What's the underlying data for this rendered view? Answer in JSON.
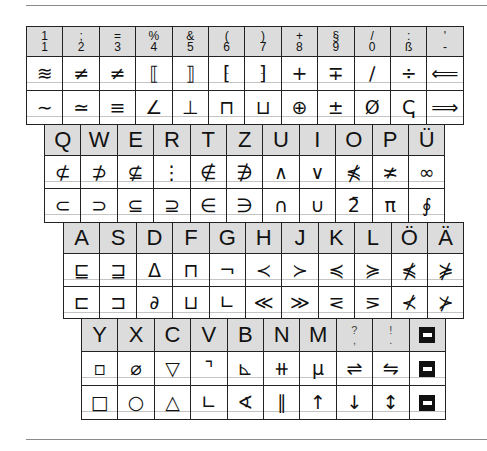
{
  "block1": {
    "header": [
      {
        "top": "1",
        "bottom": "1"
      },
      {
        "top": ";",
        "bottom": "2"
      },
      {
        "top": "=",
        "bottom": "3"
      },
      {
        "top": "%",
        "bottom": "4"
      },
      {
        "top": "&",
        "bottom": "5"
      },
      {
        "top": "(",
        "bottom": "6"
      },
      {
        "top": ")",
        "bottom": "7"
      },
      {
        "top": "+",
        "bottom": "8"
      },
      {
        "top": "§",
        "bottom": "9"
      },
      {
        "top": "/",
        "bottom": "0"
      },
      {
        "top": ":",
        "bottom": "ß"
      },
      {
        "top": "'",
        "bottom": "-"
      }
    ],
    "row2": [
      "≋",
      "≠",
      "≠",
      "⟦",
      "⟧",
      "⁅",
      "⁆",
      "+",
      "∓",
      "∕",
      "÷",
      "⟸"
    ],
    "row3": [
      "∼",
      "≃",
      "≡",
      "∠",
      "⊥",
      "⊓",
      "⊔",
      "⊕",
      "±",
      "Ø",
      "ↅ",
      "⟹"
    ]
  },
  "block2": {
    "header": [
      "Q",
      "W",
      "E",
      "R",
      "T",
      "Z",
      "U",
      "I",
      "O",
      "P",
      "Ü"
    ],
    "row2": [
      "⊄",
      "⊅",
      "⊈",
      "⋮",
      "∉",
      "∌",
      "∧",
      "∨",
      "⋠",
      "≭",
      "∞"
    ],
    "row3": [
      "⊂",
      "⊃",
      "⊆",
      "⊇",
      "∈",
      "∋",
      "∩",
      "∪",
      "2̄",
      "π",
      "∮"
    ]
  },
  "block3": {
    "header": [
      "A",
      "S",
      "D",
      "F",
      "G",
      "H",
      "J",
      "K",
      "L",
      "Ö",
      "Ä"
    ],
    "row2": [
      "⊑",
      "⊒",
      "Δ",
      "⊓",
      "¬",
      "≺",
      "≻",
      "≼",
      "≽",
      "⋠",
      "⋡"
    ],
    "row3": [
      "⊏",
      "⊐",
      "∂",
      "⊔",
      "∟",
      "≪",
      "≫",
      "⋜",
      "⋝",
      "⊀",
      "⊁"
    ]
  },
  "block4": {
    "header": [
      {
        "type": "letter",
        "label": "Y"
      },
      {
        "type": "letter",
        "label": "X"
      },
      {
        "type": "letter",
        "label": "C"
      },
      {
        "type": "letter",
        "label": "V"
      },
      {
        "type": "letter",
        "label": "B"
      },
      {
        "type": "letter",
        "label": "N"
      },
      {
        "type": "letter",
        "label": "M"
      },
      {
        "type": "pair",
        "top": "?",
        "bottom": ","
      },
      {
        "type": "pair",
        "top": "!",
        "bottom": "."
      },
      {
        "type": "blackkey",
        "label": "minus-key"
      }
    ],
    "row2": [
      "▫",
      "⌀",
      "▽",
      "⌝",
      "⊾",
      "⧺",
      "μ",
      "⇌",
      "⇋",
      "BLACKKEY"
    ],
    "row3": [
      "□",
      "○",
      "△",
      "∟",
      "∢",
      "∥",
      "↑",
      "↓",
      "↕",
      "BLACKKEY"
    ]
  }
}
